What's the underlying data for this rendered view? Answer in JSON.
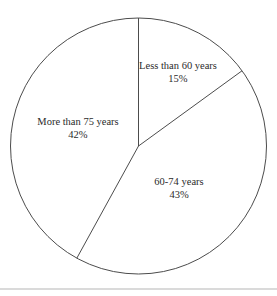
{
  "page": {
    "background": "#ffffff",
    "divider_color": "#dadada"
  },
  "chart_data": {
    "type": "pie",
    "title": "",
    "legend": "none",
    "direction": "clockwise",
    "start_angle_deg": 0,
    "categories": [
      "Less than 60 years",
      "60-74 years",
      "More than 75 years"
    ],
    "values": [
      15,
      43,
      42
    ],
    "slices": [
      {
        "label": "Less than 60 years",
        "value": 15,
        "value_label": "15%",
        "label_x": 178,
        "label_y": 72
      },
      {
        "label": "60-74 years",
        "value": 43,
        "value_label": "43%",
        "label_x": 179,
        "label_y": 188
      },
      {
        "label": "More than 75 years",
        "value": 42,
        "value_label": "42%",
        "label_x": 78,
        "label_y": 128
      }
    ],
    "geometry": {
      "center_x": 138.5,
      "center_y": 146,
      "radius": 128
    },
    "style": {
      "fill_color": "#ffffff",
      "stroke_color": "#4c4c4c",
      "stroke_width": 1,
      "label_color": "#2b2b2b"
    }
  }
}
